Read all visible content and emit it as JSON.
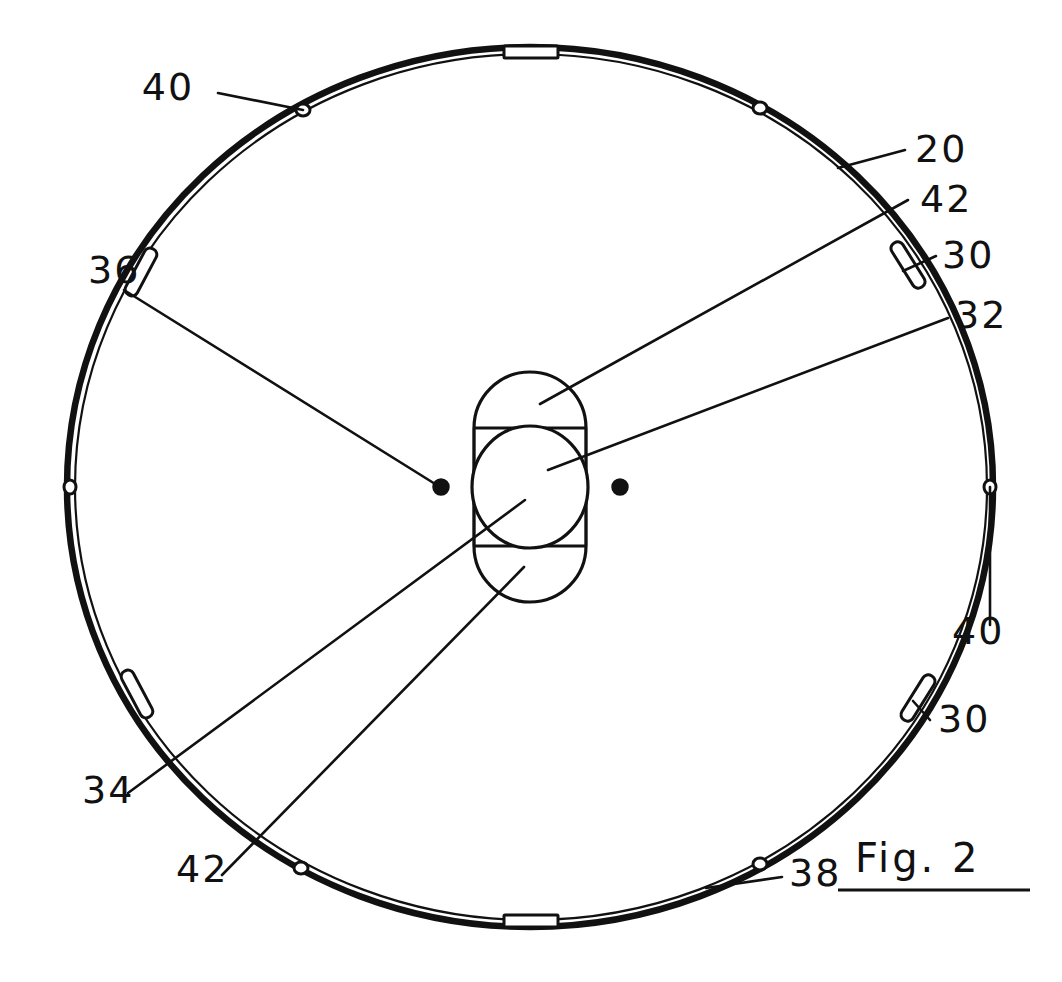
{
  "figure": {
    "caption": "Fig. 2",
    "title": "Fig. 2",
    "background_color": "#ffffff",
    "ink_color": "#111111",
    "width": 1062,
    "height": 982
  },
  "reference_numerals": [
    {
      "id": "ref-20",
      "text": "20",
      "name": "disc-body",
      "label_x": 915,
      "label_y": 162,
      "leader": [
        [
          905,
          150
        ],
        [
          838,
          168
        ]
      ],
      "points_to": "disc outer rim, upper right"
    },
    {
      "id": "ref-42-upper",
      "text": "42",
      "name": "hub-lobe-upper",
      "label_x": 920,
      "label_y": 212,
      "leader": [
        [
          908,
          200
        ],
        [
          540,
          404
        ]
      ],
      "points_to": "upper lobe of center hub"
    },
    {
      "id": "ref-30-upper",
      "text": "30",
      "name": "rim-slot-upper-right",
      "label_x": 942,
      "label_y": 268,
      "leader": [
        [
          936,
          256
        ],
        [
          905,
          268
        ]
      ],
      "points_to": "elongated slot on rim, upper right"
    },
    {
      "id": "ref-32",
      "text": "32",
      "name": "center-bore",
      "label_x": 955,
      "label_y": 328,
      "leader": [
        [
          948,
          318
        ],
        [
          548,
          470
        ]
      ],
      "points_to": "central circular bore"
    },
    {
      "id": "ref-40-upper-left",
      "text": "40",
      "name": "rim-hole-upper-left",
      "label_x": 168,
      "label_y": 100,
      "leader": [
        [
          218,
          93
        ],
        [
          303,
          110
        ]
      ],
      "points_to": "small hole on rim, upper left"
    },
    {
      "id": "ref-36",
      "text": "36",
      "name": "pin-hole-left",
      "label_x": 88,
      "label_y": 283,
      "leader": [
        [
          124,
          290
        ],
        [
          440,
          487
        ]
      ],
      "points_to": "left pin dot beside hub"
    },
    {
      "id": "ref-40-right",
      "text": "40",
      "name": "rim-hole-right",
      "label_x": 952,
      "label_y": 644,
      "leader": [
        [
          990,
          625
        ],
        [
          990,
          487
        ]
      ],
      "points_to": "small hole on rim, right"
    },
    {
      "id": "ref-30-lower",
      "text": "30",
      "name": "rim-slot-lower-right",
      "label_x": 938,
      "label_y": 732,
      "leader": [
        [
          930,
          720
        ],
        [
          915,
          700
        ]
      ],
      "points_to": "elongated slot on rim, lower right"
    },
    {
      "id": "ref-34",
      "text": "34",
      "name": "hub-bore-inner",
      "label_x": 82,
      "label_y": 803,
      "leader": [
        [
          128,
          793
        ],
        [
          525,
          500
        ]
      ],
      "points_to": "inner circle of hub"
    },
    {
      "id": "ref-42-lower",
      "text": "42",
      "name": "hub-lobe-lower",
      "label_x": 176,
      "label_y": 882,
      "leader": [
        [
          222,
          875
        ],
        [
          524,
          567
        ]
      ],
      "points_to": "lower lobe of center hub"
    },
    {
      "id": "ref-38",
      "text": "38",
      "name": "rim-edge-lower-right",
      "label_x": 789,
      "label_y": 886,
      "leader": [
        [
          782,
          877
        ],
        [
          706,
          888
        ]
      ],
      "points_to": "disc rim edge, lower right"
    }
  ],
  "disc": {
    "name": "rotary-disc",
    "center": [
      530,
      487
    ],
    "radius_x": 463,
    "radius_y": 440,
    "outer_stroke_width": 6.5
  },
  "hub": {
    "name": "center-hub",
    "center": [
      530,
      487
    ],
    "stadium_width": 112,
    "stadium_height": 230,
    "corner_radius": 56,
    "bore_radius": 58,
    "divider_offset": 56
  },
  "pin_dots": [
    {
      "name": "pin-dot-left",
      "x": 441,
      "y": 487,
      "r": 8
    },
    {
      "name": "pin-dot-right",
      "x": 620,
      "y": 487,
      "r": 8
    }
  ],
  "rim_features": [
    {
      "name": "rim-tab-top",
      "type": "tab",
      "angle_deg": -90,
      "length": 52,
      "thickness": 12
    },
    {
      "name": "rim-tab-bottom",
      "type": "tab",
      "angle_deg": 90,
      "length": 52,
      "thickness": 12
    },
    {
      "name": "rim-slot-upper-right",
      "type": "slot",
      "angle_deg": -36,
      "length": 52,
      "thickness": 13
    },
    {
      "name": "rim-slot-lower-right",
      "type": "slot",
      "angle_deg": 28,
      "length": 52,
      "thickness": 13
    },
    {
      "name": "rim-slot-upper-left",
      "type": "slot",
      "angle_deg": -145,
      "length": 52,
      "thickness": 13
    },
    {
      "name": "rim-slot-lower-left",
      "type": "slot",
      "angle_deg": 153,
      "length": 52,
      "thickness": 13
    },
    {
      "name": "rim-hole-upper-left",
      "type": "hole",
      "angle_deg": -121,
      "r": 7
    },
    {
      "name": "rim-hole-upper-right",
      "type": "hole",
      "angle_deg": -60,
      "r": 7
    },
    {
      "name": "rim-hole-left",
      "type": "hole",
      "angle_deg": 180,
      "r": 7
    },
    {
      "name": "rim-hole-right",
      "type": "hole",
      "angle_deg": 0,
      "r": 7
    },
    {
      "name": "rim-hole-lower-left",
      "type": "hole",
      "angle_deg": 118,
      "r": 7
    },
    {
      "name": "rim-hole-lower-right",
      "type": "hole",
      "angle_deg": 62,
      "r": 7
    }
  ]
}
